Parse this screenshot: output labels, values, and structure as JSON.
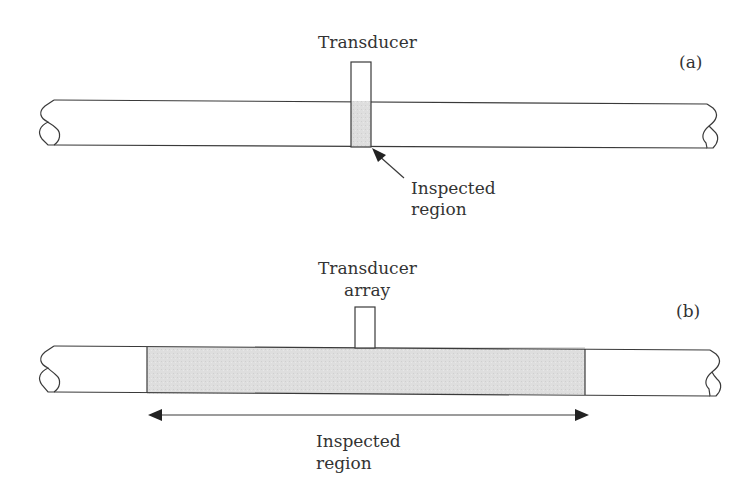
{
  "panel_a": {
    "tag": "(a)",
    "transducer_label": "Transducer",
    "region_label_line1": "Inspected",
    "region_label_line2": "region"
  },
  "panel_b": {
    "tag": "(b)",
    "transducer_label_line1": "Transducer",
    "transducer_label_line2": "array",
    "region_label_line1": "Inspected",
    "region_label_line2": "region"
  },
  "colors": {
    "line": "#3a3a3a",
    "shade": "#dcdcdc"
  }
}
